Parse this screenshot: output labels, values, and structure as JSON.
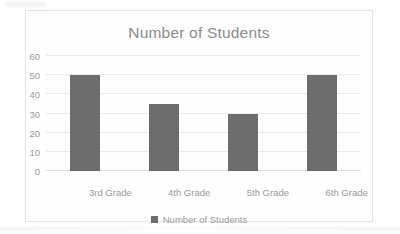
{
  "chart_data": {
    "type": "bar",
    "title": "Number of Students",
    "xlabel": "",
    "ylabel": "",
    "categories": [
      "3rd Grade",
      "4th Grade",
      "5th Grade",
      "6th Grade"
    ],
    "values": [
      50,
      35,
      30,
      50
    ],
    "series": [
      {
        "name": "Number of Students",
        "values": [
          50,
          35,
          30,
          50
        ]
      }
    ],
    "ylim": [
      0,
      60
    ],
    "yticks": [
      0,
      10,
      20,
      30,
      40,
      50,
      60
    ],
    "ytick_labels": [
      "0",
      "10",
      "20",
      "30",
      "40",
      "50",
      "60"
    ],
    "grid": true,
    "legend": {
      "position": "bottom",
      "entries": [
        "Number of Students"
      ]
    },
    "colors": {
      "bar": "#595959",
      "legend_swatch": "#6e6e6e",
      "gridline": "#eaeaea",
      "text": "#9a9a9a",
      "title_text": "#8c8c8c",
      "frame_border": "#e3e3e3",
      "background": "#ffffff"
    }
  },
  "legend": {
    "swatch_icon": "square-marker-icon",
    "label": "Number of Students"
  }
}
